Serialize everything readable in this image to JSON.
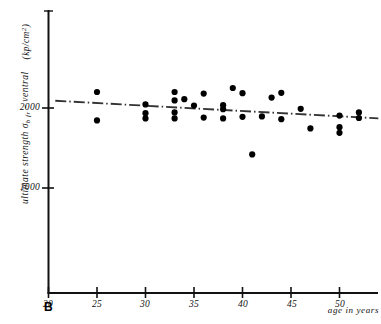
{
  "figure": {
    "panel_label": "B",
    "background_color": "#ffffff",
    "ink_color": "#111111"
  },
  "axes": {
    "y_title_main": "ultimate strength",
    "y_symbol_base": "σ",
    "y_symbol_sub": "b fr",
    "y_title_tail": "- ventral",
    "y_units": "(kp/cm",
    "y_units_sup": "2",
    "y_units_close": ")",
    "x_title": "age in years",
    "y_ticks": [
      "2000",
      "1000"
    ],
    "x_ticks": [
      "20",
      "25",
      "30",
      "35",
      "40",
      "45",
      "50"
    ]
  },
  "chart_data": {
    "type": "scatter",
    "title": "",
    "subtitle": "",
    "panel": "B",
    "xlabel": "age in years",
    "ylabel": "ultimate strength σ_b fr - ventral (kp/cm^2)",
    "xlim": [
      20,
      54
    ],
    "ylim": [
      0,
      2600
    ],
    "x_tick_values": [
      20,
      25,
      30,
      35,
      40,
      45,
      50
    ],
    "y_tick_values": [
      1000,
      2000
    ],
    "grid": false,
    "legend": null,
    "marker": "filled-circle",
    "marker_color": "#000000",
    "series": [
      {
        "name": "ultimate strength ventral",
        "points": [
          {
            "x": 25,
            "y": 2200
          },
          {
            "x": 25,
            "y": 1845
          },
          {
            "x": 30,
            "y": 2045
          },
          {
            "x": 30,
            "y": 1935
          },
          {
            "x": 30,
            "y": 1870
          },
          {
            "x": 33,
            "y": 2200
          },
          {
            "x": 33,
            "y": 2095
          },
          {
            "x": 33,
            "y": 1945
          },
          {
            "x": 33,
            "y": 1870
          },
          {
            "x": 34,
            "y": 2110
          },
          {
            "x": 35,
            "y": 2030
          },
          {
            "x": 36,
            "y": 2180
          },
          {
            "x": 36,
            "y": 1880
          },
          {
            "x": 38,
            "y": 2035
          },
          {
            "x": 38,
            "y": 1985
          },
          {
            "x": 38,
            "y": 1870
          },
          {
            "x": 39,
            "y": 2250
          },
          {
            "x": 40,
            "y": 2185
          },
          {
            "x": 40,
            "y": 1890
          },
          {
            "x": 41,
            "y": 1420
          },
          {
            "x": 42,
            "y": 1895
          },
          {
            "x": 43,
            "y": 2130
          },
          {
            "x": 44,
            "y": 2190
          },
          {
            "x": 44,
            "y": 1860
          },
          {
            "x": 46,
            "y": 1990
          },
          {
            "x": 47,
            "y": 1745
          },
          {
            "x": 50,
            "y": 1905
          },
          {
            "x": 50,
            "y": 1760
          },
          {
            "x": 50,
            "y": 1690
          },
          {
            "x": 52,
            "y": 1945
          },
          {
            "x": 52,
            "y": 1875
          }
        ]
      }
    ],
    "trend_line": {
      "style": "dash-dot",
      "color": "#333333",
      "x_start": 20.7,
      "y_start": 2090,
      "x_end": 54.0,
      "y_end": 1870
    }
  }
}
